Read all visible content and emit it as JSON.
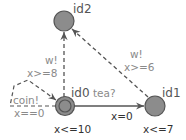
{
  "colors": {
    "location_fill": "#8c8c8c",
    "location_stroke": "#555555",
    "edge": "#555555",
    "sync_text": "#8a8a8a",
    "guard_text": "#8a8a8a",
    "update_text": "#333333",
    "invariant_text": "#333333",
    "name_text": "#555555"
  },
  "locations": [
    {
      "id": "id0",
      "name": "id0",
      "initial": true,
      "invariant": "x<=10"
    },
    {
      "id": "id1",
      "name": "id1",
      "initial": false,
      "invariant": "x<=7"
    },
    {
      "id": "id2",
      "name": "id2",
      "initial": false,
      "invariant": ""
    }
  ],
  "edges": [
    {
      "from": "id0",
      "to": "id1",
      "style": "solid",
      "sync": "tea?",
      "guard": "",
      "update": "x=0"
    },
    {
      "from": "id1",
      "to": "id2",
      "style": "dashed",
      "sync": "w!",
      "guard": "x>=6",
      "update": ""
    },
    {
      "from": "id0",
      "to": "id2",
      "style": "dashed",
      "sync": "w!",
      "guard": "x>=8",
      "update": ""
    },
    {
      "from": "id0",
      "to": "id0",
      "style": "dashed",
      "sync": "coin!",
      "guard": "x==0",
      "update": ""
    }
  ]
}
